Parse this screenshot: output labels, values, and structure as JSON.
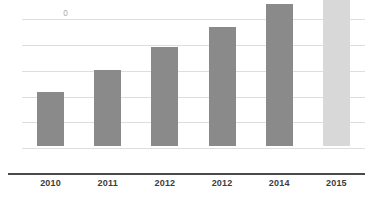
{
  "chart_data": {
    "type": "bar",
    "title": "",
    "subtitle": "",
    "xlabel": "",
    "ylabel": "",
    "categories": [
      "2010",
      "2011",
      "2012",
      "2012",
      "2014",
      "2015"
    ],
    "values": [
      210000,
      295000,
      385000,
      460000,
      550000,
      625000
    ],
    "series": [
      {
        "name": "",
        "values": [
          210000,
          295000,
          385000,
          460000,
          550000,
          625000
        ]
      }
    ],
    "ylim": [
      0,
      600000
    ],
    "y_ticks": [
      0,
      100000,
      200000,
      300000,
      400000,
      500000,
      600000
    ],
    "y_tick_labels": [
      "0",
      "100,000",
      "200,000",
      "300,000",
      "400,000",
      "500,000",
      "600,000"
    ],
    "grid": true,
    "grid_axis": "y",
    "legend": false,
    "legend_position": "none",
    "annotations": [],
    "bar_colors": [
      "#8a8a8a",
      "#8a8a8a",
      "#8a8a8a",
      "#8a8a8a",
      "#8a8a8a",
      "#d8d8d8"
    ],
    "colors": {
      "bar_default": "#8a8a8a",
      "bar_highlight": "#d8d8d8",
      "gridline": "#dededc",
      "axis_line": "#4a4a4a",
      "y_tick_text": "#a9a9a7",
      "x_tick_text": "#3c3c3c",
      "background": "#ffffff"
    }
  }
}
